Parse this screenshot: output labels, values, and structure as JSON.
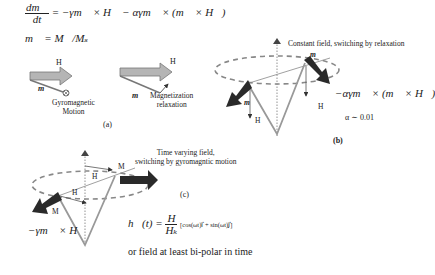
{
  "equations": {
    "llg_lhs_num": "dm⃗",
    "llg_lhs_den": "dt",
    "llg_rhs": "= −γm⃗ × H⃗ − αγm⃗ × (m⃗ × H⃗)",
    "normalization": "m⃗ = M⃗/Mₛ"
  },
  "panel_a": {
    "label": "(a)",
    "left": {
      "field_label": "H",
      "moment_label": "m",
      "caption_line1": "Gyromagnetic",
      "caption_line2": "Motion"
    },
    "right": {
      "field_label": "H",
      "moment_label": "m",
      "caption_line1": "Magnetization",
      "caption_line2": "relaxation"
    }
  },
  "panel_b": {
    "label": "(b)",
    "title": "Constant field, switching by relaxation",
    "moment_label_top": "m",
    "moment_label_left": "m",
    "field_label_left": "H",
    "field_label_right": "H",
    "torque_label": "−αγm⃗ × (m⃗ × H⃗)",
    "damping": "α ∼ 0.01"
  },
  "panel_c": {
    "label": "(c)",
    "title_line1": "Time varying field,",
    "title_line2": "switching by gyromagntic motion",
    "moment_label_top": "M",
    "moment_label_left": "M",
    "field_label_top": "H",
    "field_label_mid": "H",
    "torque_label": "−γm⃗ × H⃗",
    "field_eq_lhs": "h⃗(t) =",
    "field_eq_num": "H",
    "field_eq_den": "Hₖ",
    "field_eq_rhs": "[cos(ωt)i⃗ + sin(ωt)j⃗]",
    "note": "or field at least bi-polar in time"
  },
  "colors": {
    "gray_arrow": "#a8a8a8",
    "dark_arrow": "#2a2a2a",
    "line": "#888888",
    "text": "#222222"
  }
}
